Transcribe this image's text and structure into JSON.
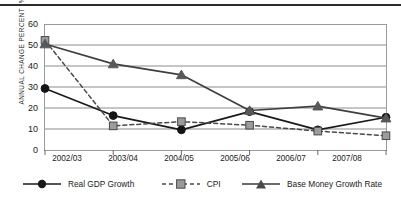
{
  "chart_data": {
    "type": "line",
    "title": "",
    "subtitle": "",
    "xlabel": "",
    "ylabel": "ANNUAL CHANGE PERCENT (%)",
    "categories": [
      "2002/03",
      "2003/04",
      "2004/05",
      "2005/06",
      "2006/07",
      "2007/08"
    ],
    "ylim": [
      0,
      60
    ],
    "ytick_step": 10,
    "yticks": [
      "60",
      "50",
      "40",
      "30",
      "20",
      "10",
      "0"
    ],
    "grid": "horizontal",
    "legend_position": "bottom",
    "series": [
      {
        "name": "Real GDP Growth",
        "marker": "circle",
        "line_style": "solid",
        "color": "#1a1a1a",
        "values": [
          29.3,
          16.4,
          9.6,
          18.3,
          9.6,
          15.6
        ]
      },
      {
        "name": "CPI",
        "marker": "square",
        "line_style": "dashed",
        "color": "#808080",
        "values": [
          52.2,
          11.5,
          13.5,
          11.8,
          9.0,
          6.8
        ]
      },
      {
        "name": "Base Money Growth Rate",
        "marker": "triangle",
        "line_style": "solid",
        "color": "#5a5a5a",
        "values": [
          50.5,
          41.0,
          35.8,
          18.8,
          20.9,
          15.2
        ]
      }
    ]
  },
  "axes": {
    "y_axis_title": "ANNUAL CHANGE PERCENT (%)"
  },
  "colors": {
    "frame": "#9a9a9a",
    "gridline": "#8c8c8c",
    "gdp": "#1a1a1a",
    "cpi": "#8a8a8a",
    "base_money": "#555555",
    "top_rule": "#2b2b2b"
  }
}
